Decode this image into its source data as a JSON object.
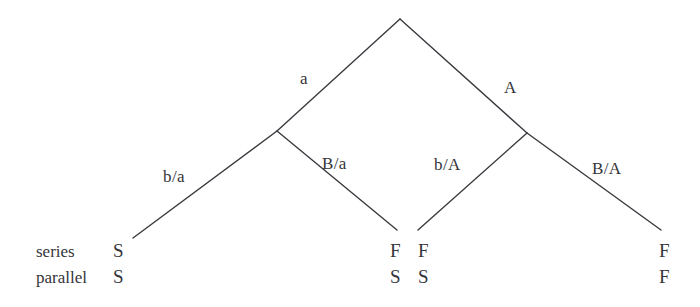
{
  "figure": {
    "type": "binary-decision-tree",
    "background_color": "#ffffff",
    "line_color": "#3a3a3f",
    "text_color": "#35353a"
  },
  "row_labels": [
    {
      "id": "series",
      "text": "series"
    },
    {
      "id": "parallel",
      "text": "parallel"
    }
  ],
  "edges": [
    {
      "id": "root-left",
      "label": "a",
      "from": [
        400,
        19
      ],
      "to": [
        277,
        131
      ]
    },
    {
      "id": "root-right",
      "label": "A",
      "from": [
        400,
        19
      ],
      "to": [
        527,
        133
      ]
    },
    {
      "id": "left-left",
      "label": "b/a",
      "from": [
        277,
        131
      ],
      "to": [
        133,
        238
      ]
    },
    {
      "id": "left-right",
      "label": "B/a",
      "from": [
        277,
        131
      ],
      "to": [
        397,
        230
      ]
    },
    {
      "id": "right-left",
      "label": "b/A",
      "from": [
        527,
        133
      ],
      "to": [
        418,
        230
      ]
    },
    {
      "id": "right-right",
      "label": "B/A",
      "from": [
        527,
        133
      ],
      "to": [
        661,
        230
      ]
    }
  ],
  "edge_labels": [
    {
      "id": "edge-label-a",
      "text": "a",
      "x": 300,
      "y": 70
    },
    {
      "id": "edge-label-A",
      "text": "A",
      "x": 504,
      "y": 79
    },
    {
      "id": "edge-label-ba",
      "text": "b/a",
      "x": 163,
      "y": 168
    },
    {
      "id": "edge-label-Ba",
      "text": "B/a",
      "x": 322,
      "y": 155
    },
    {
      "id": "edge-label-bA",
      "text": "b/A",
      "x": 434,
      "y": 156
    },
    {
      "id": "edge-label-BA",
      "text": "B/A",
      "x": 592,
      "y": 160
    }
  ],
  "leaves": [
    {
      "id": "leaf-1",
      "x": 113,
      "series": "S",
      "parallel": "S"
    },
    {
      "id": "leaf-2",
      "x": 390,
      "series": "F",
      "parallel": "S"
    },
    {
      "id": "leaf-3",
      "x": 418,
      "series": "F",
      "parallel": "S"
    },
    {
      "id": "leaf-4",
      "x": 659,
      "series": "F",
      "parallel": "F"
    }
  ],
  "rows": {
    "series_y": 243,
    "parallel_y": 269,
    "label_x": 36
  }
}
